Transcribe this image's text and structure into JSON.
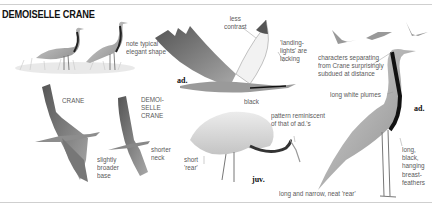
{
  "title": "DEMOISELLE CRANE",
  "labels": {
    "note_shape": "note typical\nelegant shape",
    "less_contrast": "less\ncontrast",
    "landing_lights": "'landing-\nlights' are\nlacking",
    "characters": "characters separating\nfrom Crane surprisingly\nsubdued at distance",
    "long_white_plumes": "long white plumes",
    "black": "black",
    "crane": "CRANE",
    "demoiselle_crane": "DEMOI-\nSELLE\nCRANE",
    "broader_base": "slightly\nbroader\nbase",
    "shorter_neck": "shorter\nneck",
    "short_rear": "short\n'rear'",
    "pattern": "pattern reminiscent\nof that of ad.'s",
    "breast_feathers": "long,\nblack,\nhanging\nbreast-\nfeathers",
    "narrow_rear": "long and narrow, neat 'rear'"
  },
  "ages": {
    "flying_adult": "ad.",
    "juvenile": "juv.",
    "standing_adult": "ad."
  },
  "colors": {
    "ink": "#111111",
    "label": "#5a5a5a",
    "body_grey": "#b9b9b9",
    "dark_grey": "#6e6e6e",
    "rule": "#cfcfcf"
  }
}
